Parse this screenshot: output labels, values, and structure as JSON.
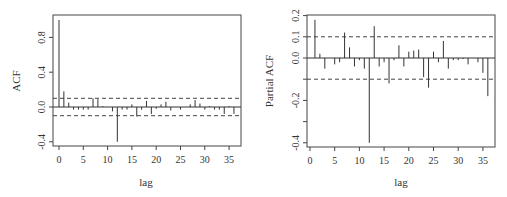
{
  "chart_data": [
    {
      "type": "bar",
      "title": "",
      "xlabel": "lag",
      "ylabel": "ACF",
      "xlim": [
        -1,
        37
      ],
      "ylim": [
        -0.45,
        1.05
      ],
      "xticks": [
        0,
        5,
        10,
        15,
        20,
        25,
        30,
        35
      ],
      "yticks": [
        -0.4,
        0.0,
        0.4,
        0.8
      ],
      "ytick_labels": [
        "-0.4",
        "0.0",
        "0.4",
        "0.8"
      ],
      "confidence_band": [
        0.1,
        -0.1
      ],
      "grid": false,
      "x": [
        0,
        1,
        2,
        3,
        4,
        5,
        6,
        7,
        8,
        9,
        10,
        11,
        12,
        13,
        14,
        15,
        16,
        17,
        18,
        19,
        20,
        21,
        22,
        23,
        24,
        25,
        26,
        27,
        28,
        29,
        30,
        31,
        32,
        33,
        34,
        35,
        36
      ],
      "values": [
        1.0,
        0.18,
        0.05,
        -0.03,
        -0.03,
        -0.03,
        -0.03,
        0.1,
        0.09,
        0.01,
        0.0,
        -0.05,
        -0.4,
        -0.03,
        -0.03,
        0.03,
        -0.11,
        -0.03,
        0.07,
        -0.08,
        -0.02,
        0.03,
        0.06,
        -0.04,
        0.0,
        -0.03,
        0.0,
        0.03,
        0.08,
        0.04,
        -0.03,
        0.01,
        -0.03,
        -0.03,
        -0.08,
        0.01,
        -0.08
      ]
    },
    {
      "type": "bar",
      "title": "",
      "xlabel": "lag",
      "ylabel": "Partial ACF",
      "xlim": [
        -1,
        37
      ],
      "ylim": [
        -0.41,
        0.2
      ],
      "xticks": [
        0,
        5,
        10,
        15,
        20,
        25,
        30,
        35
      ],
      "yticks": [
        -0.4,
        -0.3,
        -0.2,
        -0.1,
        0.0,
        0.1,
        0.2
      ],
      "ytick_labels": [
        "-0.4",
        "",
        "-0.2",
        "",
        "0.0",
        "0.1",
        "0.2"
      ],
      "confidence_band": [
        0.1,
        -0.1
      ],
      "grid": false,
      "x": [
        1,
        2,
        3,
        4,
        5,
        6,
        7,
        8,
        9,
        10,
        11,
        12,
        13,
        14,
        15,
        16,
        17,
        18,
        19,
        20,
        21,
        22,
        23,
        24,
        25,
        26,
        27,
        28,
        29,
        30,
        31,
        32,
        33,
        34,
        35,
        36
      ],
      "values": [
        0.18,
        0.02,
        -0.05,
        0.0,
        -0.03,
        -0.02,
        0.12,
        0.05,
        -0.04,
        -0.01,
        -0.05,
        -0.4,
        0.15,
        -0.04,
        -0.02,
        -0.12,
        -0.01,
        0.06,
        -0.04,
        0.03,
        0.035,
        0.04,
        -0.09,
        -0.14,
        0.03,
        -0.02,
        0.08,
        -0.05,
        -0.01,
        -0.01,
        -0.005,
        -0.03,
        0.0,
        -0.02,
        -0.07,
        -0.18
      ]
    }
  ],
  "labels": {
    "acf_ylabel": "ACF",
    "pacf_ylabel": "Partial ACF",
    "xlabel": "lag"
  },
  "colors": {
    "axis": "#444444",
    "spike": "#333333",
    "band": "#444444"
  }
}
